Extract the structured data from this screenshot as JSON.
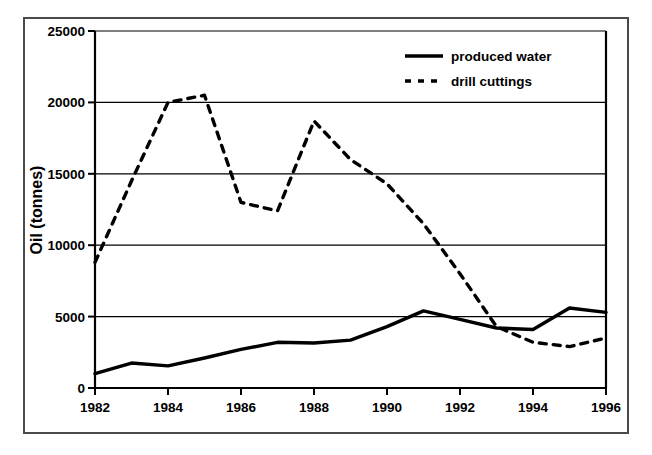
{
  "chart_data": {
    "type": "line",
    "title": "",
    "xlabel": "",
    "ylabel": "Oil (tonnes)",
    "xlim": [
      1982,
      1996
    ],
    "ylim": [
      0,
      25000
    ],
    "grid": true,
    "legend_position": "top-right",
    "x": [
      1982,
      1983,
      1984,
      1985,
      1986,
      1987,
      1988,
      1989,
      1990,
      1991,
      1992,
      1993,
      1994,
      1995,
      1996
    ],
    "xticks": [
      1982,
      1984,
      1986,
      1988,
      1990,
      1992,
      1994,
      1996
    ],
    "xtick_labels": [
      "1982",
      "1984",
      "1986",
      "1988",
      "1990",
      "1992",
      "1994",
      "1996"
    ],
    "yticks": [
      0,
      5000,
      10000,
      15000,
      20000,
      25000
    ],
    "ytick_labels": [
      "0",
      "5000",
      "10000",
      "15000",
      "20000",
      "25000"
    ],
    "series": [
      {
        "name": "produced water",
        "style": "solid",
        "color": "#000000",
        "values": [
          1000,
          1750,
          1550,
          2100,
          2700,
          3200,
          3150,
          3350,
          4300,
          5400,
          4800,
          4200,
          4100,
          5600,
          5300
        ]
      },
      {
        "name": "drill cuttings",
        "style": "dashed",
        "color": "#000000",
        "values": [
          8800,
          14500,
          20000,
          20500,
          13000,
          12400,
          18700,
          16000,
          14300,
          11500,
          8000,
          4300,
          3200,
          2900,
          3500
        ]
      }
    ]
  },
  "axis": {
    "y_title": "Oil (tonnes)",
    "y_labels": [
      "25000",
      "20000",
      "15000",
      "10000",
      "5000",
      "0"
    ],
    "x_labels": [
      "1982",
      "1984",
      "1986",
      "1988",
      "1990",
      "1992",
      "1994",
      "1996"
    ]
  },
  "legend": {
    "entries": [
      {
        "label": "produced water",
        "style": "solid"
      },
      {
        "label": "drill cuttings",
        "style": "dashed"
      }
    ]
  }
}
